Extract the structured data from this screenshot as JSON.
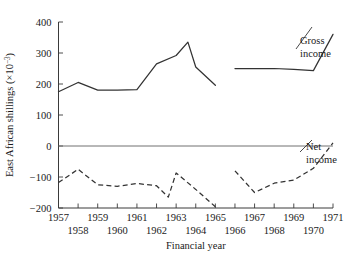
{
  "chart_data": {
    "type": "line",
    "title": "",
    "xlabel": "Financial year",
    "ylabel": "East African shillings (×10⁻³)",
    "ylabel_main": "East African shillings (×10",
    "ylabel_exponent": "−3",
    "ylabel_close": ")",
    "xlim": [
      1957,
      1971
    ],
    "ylim": [
      -200,
      400
    ],
    "grid": false,
    "legend_position": "inline-right",
    "ytick_labels": [
      "400",
      "300",
      "200",
      "100",
      "0",
      "−100",
      "−200"
    ],
    "ytick_values": [
      400,
      300,
      200,
      100,
      0,
      -100,
      -200
    ],
    "xtick_values": [
      1957,
      1958,
      1959,
      1960,
      1961,
      1962,
      1963,
      1964,
      1965,
      1966,
      1967,
      1968,
      1969,
      1970,
      1971
    ],
    "xtick_labels_upper": [
      "1957",
      "1959",
      "1961",
      "1963",
      "1965",
      "1967",
      "1969",
      "1971"
    ],
    "xtick_labels_lower": [
      "1958",
      "1960",
      "1962",
      "1964",
      "1966",
      "1968",
      "1970"
    ],
    "xtick_upper_values": [
      1957,
      1959,
      1961,
      1963,
      1965,
      1967,
      1969,
      1971
    ],
    "xtick_lower_values": [
      1958,
      1960,
      1962,
      1964,
      1966,
      1968,
      1970
    ],
    "series": [
      {
        "name": "Gross income",
        "label_line1": "Gross",
        "label_line2": "income",
        "style": "solid",
        "color": "#333333",
        "segments": [
          {
            "x": [
              1957,
              1958,
              1959,
              1960,
              1961,
              1962,
              1963,
              1963.6,
              1964,
              1965
            ],
            "y": [
              175,
              205,
              180,
              180,
              182,
              265,
              292,
              335,
              255,
              196
            ]
          },
          {
            "x": [
              1966,
              1967,
              1968,
              1969,
              1970,
              1971
            ],
            "y": [
              250,
              250,
              250,
              247,
              243,
              360
            ]
          }
        ]
      },
      {
        "name": "Net income",
        "label_line1": "Net",
        "label_line2": "income",
        "style": "dashed",
        "color": "#333333",
        "segments": [
          {
            "x": [
              1957,
              1958,
              1959,
              1960,
              1961,
              1962,
              1962.6,
              1963,
              1964,
              1965
            ],
            "y": [
              -118,
              -75,
              -125,
              -130,
              -121,
              -128,
              -165,
              -87,
              -140,
              -196
            ]
          },
          {
            "x": [
              1966,
              1967,
              1968,
              1969,
              1970,
              1971
            ],
            "y": [
              -80,
              -150,
              -120,
              -110,
              -72,
              10
            ]
          }
        ]
      }
    ]
  }
}
